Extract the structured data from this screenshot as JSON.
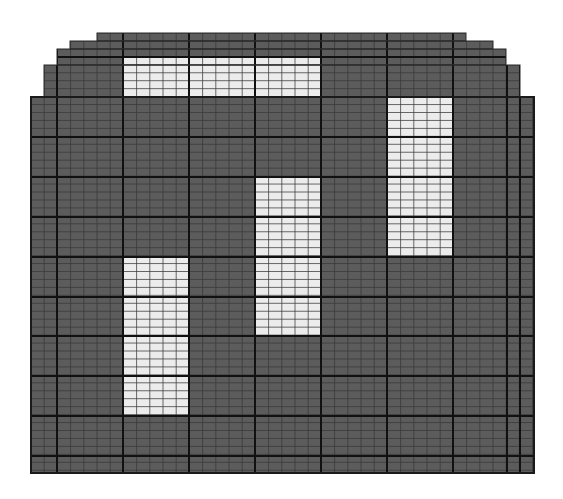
{
  "diagram": {
    "type": "wafer-map-grid",
    "colors": {
      "background": "#ffffff",
      "die_fill": "#5c5c5c",
      "highlight_fill": "#ececec",
      "minor_line": "#3a3a3a",
      "major_line": "#111111"
    },
    "outline_rows": [
      {
        "y0": 33,
        "y1": 41,
        "x0": 97,
        "x1": 466
      },
      {
        "y0": 41,
        "y1": 49,
        "x0": 70,
        "x1": 493
      },
      {
        "y0": 49,
        "y1": 65,
        "x0": 57,
        "x1": 506
      },
      {
        "y0": 65,
        "y1": 97,
        "x0": 44,
        "x1": 520
      },
      {
        "y0": 97,
        "y1": 473,
        "x0": 31,
        "x1": 534
      }
    ],
    "minor_step_x": 13.2,
    "minor_origin_x": 31,
    "minor_step_y": 7.95,
    "minor_origin_y": 33,
    "major_x": [
      57,
      123,
      189,
      255,
      321,
      387,
      453,
      507,
      520
    ],
    "major_y": [
      57,
      97,
      137,
      177,
      217,
      257,
      297,
      336,
      376,
      416,
      456
    ],
    "highlight_blocks": [
      {
        "name": "highlight-block-top",
        "x0": 123,
        "y0": 57,
        "x1": 321,
        "y1": 97
      },
      {
        "name": "highlight-block-right",
        "x0": 387,
        "y0": 97,
        "x1": 453,
        "y1": 256
      },
      {
        "name": "highlight-block-middle",
        "x0": 255,
        "y0": 177,
        "x1": 321,
        "y1": 336
      },
      {
        "name": "highlight-block-left",
        "x0": 123,
        "y0": 257,
        "x1": 189,
        "y1": 416
      }
    ]
  }
}
